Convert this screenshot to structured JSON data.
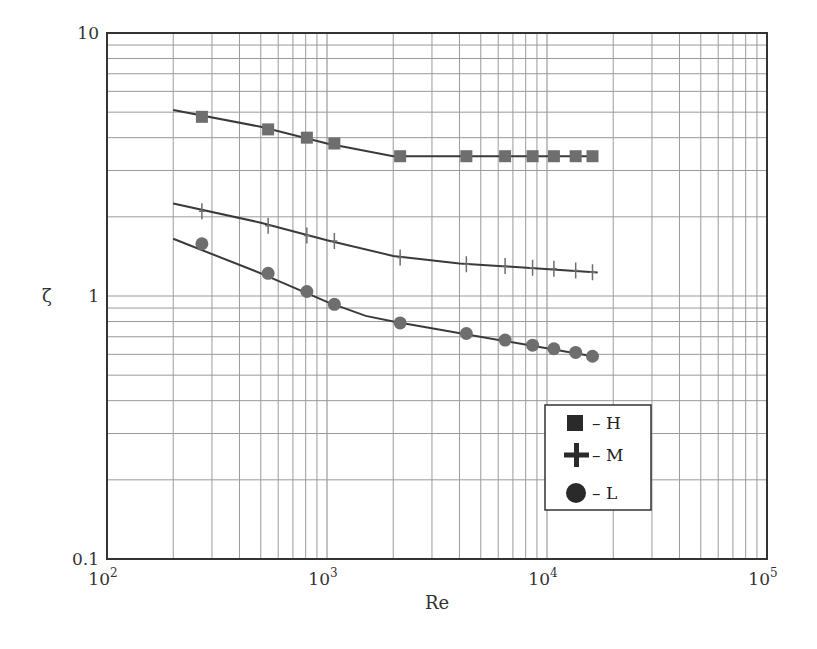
{
  "chart_data": {
    "type": "line",
    "title": "",
    "xlabel": "Re",
    "ylabel": "ζ",
    "xscale": "log",
    "yscale": "log",
    "xlim": [
      100,
      100000
    ],
    "ylim": [
      0.1,
      10
    ],
    "grid": true,
    "legend_position": "lower right inside",
    "x_tick_labels": [
      {
        "value": 100,
        "base": "10",
        "exp": "2"
      },
      {
        "value": 1000,
        "base": "10",
        "exp": "3"
      },
      {
        "value": 10000,
        "base": "10",
        "exp": "4"
      },
      {
        "value": 100000,
        "base": "10",
        "exp": "5"
      }
    ],
    "y_tick_labels": [
      {
        "value": 10,
        "label": "10"
      },
      {
        "value": 1,
        "label": "1"
      },
      {
        "value": 0.1,
        "label": "0.1"
      }
    ],
    "series": [
      {
        "name": "H",
        "legend_label": "– H",
        "marker": "square",
        "color": "#6e6e6e",
        "points": [
          [
            270,
            4.8
          ],
          [
            540,
            4.3
          ],
          [
            810,
            4.0
          ],
          [
            1080,
            3.8
          ],
          [
            2150,
            3.4
          ],
          [
            4300,
            3.4
          ],
          [
            6450,
            3.4
          ],
          [
            8600,
            3.4
          ],
          [
            10750,
            3.4
          ],
          [
            13500,
            3.4
          ],
          [
            16100,
            3.4
          ]
        ],
        "fit_line": [
          [
            200,
            5.1
          ],
          [
            500,
            4.4
          ],
          [
            1000,
            3.8
          ],
          [
            2000,
            3.4
          ],
          [
            16100,
            3.4
          ]
        ]
      },
      {
        "name": "M",
        "legend_label": "– M",
        "marker": "plus",
        "color": "#6e6e6e",
        "points": [
          [
            270,
            2.1
          ],
          [
            540,
            1.85
          ],
          [
            810,
            1.7
          ],
          [
            1080,
            1.62
          ],
          [
            2150,
            1.4
          ],
          [
            4300,
            1.32
          ],
          [
            6450,
            1.3
          ],
          [
            8600,
            1.28
          ],
          [
            10750,
            1.27
          ],
          [
            13500,
            1.25
          ],
          [
            16100,
            1.23
          ]
        ],
        "fit_line": [
          [
            200,
            2.25
          ],
          [
            500,
            1.9
          ],
          [
            1000,
            1.63
          ],
          [
            2000,
            1.42
          ],
          [
            4000,
            1.33
          ],
          [
            17000,
            1.23
          ]
        ]
      },
      {
        "name": "L",
        "legend_label": "– L",
        "marker": "circle",
        "color": "#6e6e6e",
        "points": [
          [
            270,
            1.58
          ],
          [
            540,
            1.22
          ],
          [
            810,
            1.04
          ],
          [
            1080,
            0.93
          ],
          [
            2150,
            0.79
          ],
          [
            4300,
            0.72
          ],
          [
            6450,
            0.68
          ],
          [
            8600,
            0.65
          ],
          [
            10750,
            0.63
          ],
          [
            13500,
            0.61
          ],
          [
            16100,
            0.59
          ]
        ],
        "fit_line": [
          [
            200,
            1.65
          ],
          [
            500,
            1.22
          ],
          [
            1000,
            0.95
          ],
          [
            1500,
            0.84
          ],
          [
            2000,
            0.8
          ],
          [
            16100,
            0.59
          ]
        ]
      }
    ]
  },
  "plot_box": {
    "left": 107,
    "top": 33,
    "right": 767,
    "bottom": 559
  },
  "colors": {
    "frame": "#333333",
    "grid": "#9a9a9a",
    "line": "#3a3a3a",
    "marker": "#6e6e6e",
    "legend_marker": "#2a2a2a"
  }
}
